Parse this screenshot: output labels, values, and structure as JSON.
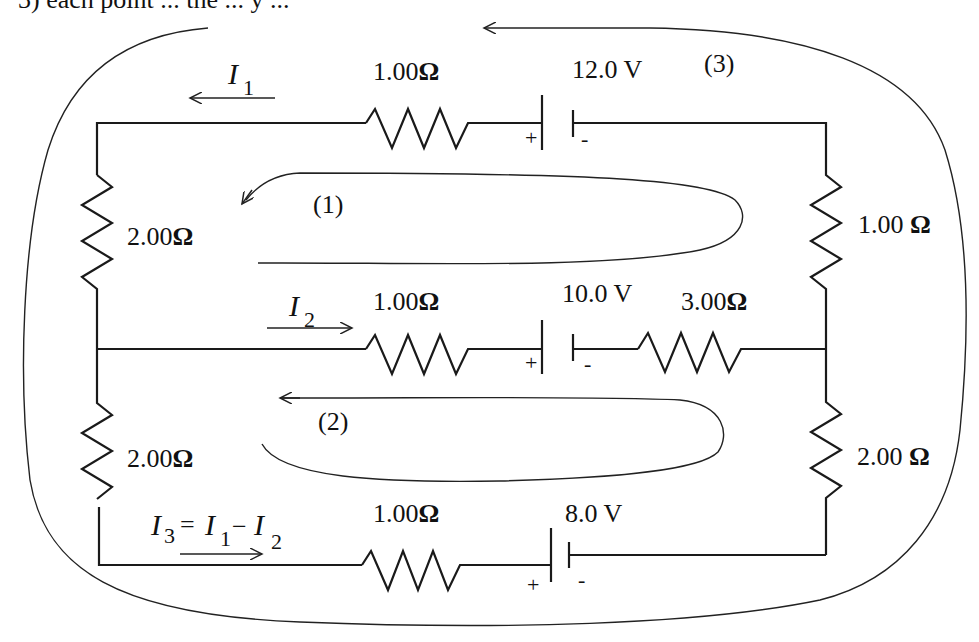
{
  "header_fragment": "3) each point ... the ... y ...",
  "circuit": {
    "top_branch": {
      "current_label": "I",
      "current_sub": "1",
      "resistor_label": "1.00",
      "battery_label": "12.0 V",
      "battery_plus": "+",
      "battery_minus": "-"
    },
    "middle_branch": {
      "current_label": "I",
      "current_sub": "2",
      "resistor1_label": "1.00",
      "battery_label": "10.0 V",
      "resistor2_label": "3.00",
      "battery_plus": "+",
      "battery_minus": "-"
    },
    "bottom_branch": {
      "current_label": "I",
      "current_sub": "3",
      "equation_eq": "=",
      "equation_i1": "I",
      "equation_i1_sub": "1",
      "equation_minus": "−",
      "equation_i2": "I",
      "equation_i2_sub": "2",
      "resistor_label": "1.00",
      "battery_label": "8.0 V",
      "battery_plus": "+",
      "battery_minus": "-"
    },
    "left_upper_resistor": "2.00",
    "left_lower_resistor": "2.00",
    "right_upper_resistor": "1.00 ",
    "right_lower_resistor": "2.00 ",
    "ohm_symbol": "Ω",
    "loops": [
      {
        "label": "(1)"
      },
      {
        "label": "(2)"
      },
      {
        "label": "(3)"
      }
    ]
  }
}
